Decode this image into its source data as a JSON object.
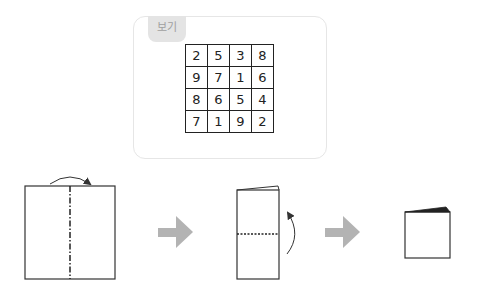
{
  "example": {
    "label": "보기",
    "grid": [
      [
        "2",
        "5",
        "3",
        "8"
      ],
      [
        "9",
        "7",
        "1",
        "6"
      ],
      [
        "8",
        "6",
        "5",
        "4"
      ],
      [
        "7",
        "1",
        "9",
        "2"
      ]
    ]
  },
  "steps": [
    {
      "name": "paper-unfolded",
      "fold_line": "dash-dot vertical",
      "fold_direction": "left-to-right"
    },
    {
      "name": "paper-folded-half",
      "fold_line": "dotted horizontal",
      "fold_direction": "bottom-to-top"
    },
    {
      "name": "paper-folded-quarter"
    }
  ],
  "colors": {
    "arrow": "#b3b3b3",
    "line": "#333333",
    "tab_bg": "#e4e4e4"
  }
}
